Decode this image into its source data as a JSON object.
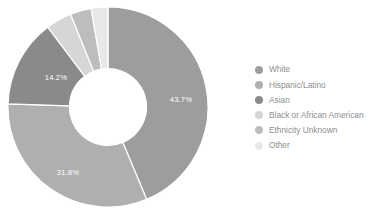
{
  "background_color": "#ffffff",
  "chart_data": {
    "type": "pie",
    "variant": "donut",
    "title": "",
    "subtitle": "",
    "xlabel": "",
    "ylabel": "",
    "start_angle_deg": 0,
    "direction": "clockwise",
    "inner_radius_ratio": 0.385,
    "legend_position": "right",
    "grid": false,
    "categories": [
      "White",
      "Hispanic/Latino",
      "Asian",
      "Black or African American",
      "Ethnicity Unknown",
      "Other"
    ],
    "values": [
      43.7,
      31.8,
      14.2,
      4.2,
      3.4,
      2.7
    ],
    "value_unit": "%",
    "colors": [
      "#9d9d9d",
      "#afafaf",
      "#8a8a8a",
      "#d6d6d6",
      "#bdbdbd",
      "#e8e8e8"
    ],
    "data_labels": [
      {
        "text": "43.7%",
        "x": 175,
        "y": 97,
        "shown": true
      },
      {
        "text": "31.8%",
        "x": 62,
        "y": 170,
        "shown": true
      },
      {
        "text": "14.2%",
        "x": 50,
        "y": 75,
        "shown": true
      },
      {
        "text": "",
        "x": 0,
        "y": 0,
        "shown": false
      },
      {
        "text": "",
        "x": 0,
        "y": 0,
        "shown": false
      },
      {
        "text": "",
        "x": 0,
        "y": 0,
        "shown": false
      }
    ],
    "annotations": []
  },
  "legend": {
    "items": [
      {
        "label": "White",
        "color": "#9d9d9d"
      },
      {
        "label": "Hispanic/Latino",
        "color": "#afafaf"
      },
      {
        "label": "Asian",
        "color": "#8a8a8a"
      },
      {
        "label": "Black or African American",
        "color": "#d6d6d6"
      },
      {
        "label": "Ethnicity Unknown",
        "color": "#bdbdbd"
      },
      {
        "label": "Other",
        "color": "#e8e8e8"
      }
    ]
  }
}
